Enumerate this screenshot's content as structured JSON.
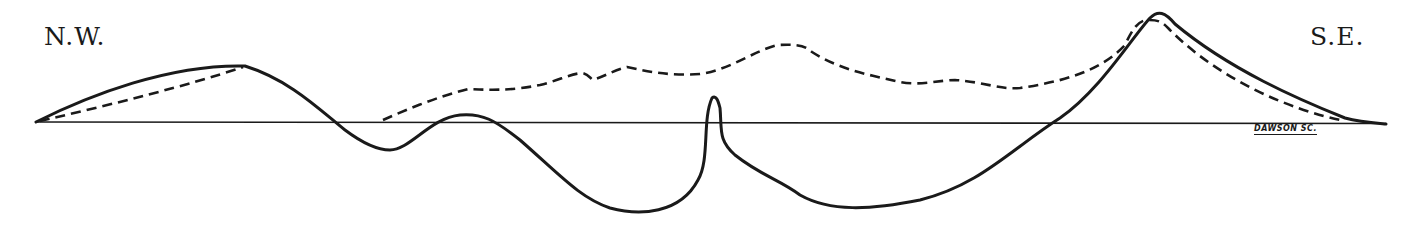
{
  "diagram": {
    "type": "cross-section profile",
    "orientation": {
      "left_label": "N.W.",
      "right_label": "S.E."
    },
    "signature": "DAWSON SC.",
    "colors": {
      "ink": "#1a1a1a",
      "background": "#ffffff"
    },
    "lines": [
      {
        "name": "baseline",
        "style": "thin solid",
        "description": "horizontal datum line"
      },
      {
        "name": "present-profile",
        "style": "thick solid",
        "description": "undulating profile dipping well below datum with a narrow central spire"
      },
      {
        "name": "restored-profile",
        "style": "dashed",
        "description": "upper dashed outline above datum rising to a peak at S.E."
      }
    ]
  }
}
